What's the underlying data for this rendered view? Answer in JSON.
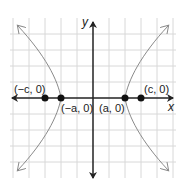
{
  "diagram": {
    "type": "hyperbola",
    "axes": {
      "x_label": "x",
      "y_label": "y"
    },
    "grid": {
      "on": true,
      "spacing_units": 1,
      "x_range": [
        -5,
        5
      ],
      "y_range": [
        -4,
        5
      ]
    },
    "points": [
      {
        "label": "(−c, 0)",
        "x": -3,
        "y": 0
      },
      {
        "label": "(−a, 0)",
        "x": -2,
        "y": 0
      },
      {
        "label": "(a, 0)",
        "x": 2,
        "y": 0
      },
      {
        "label": "(c, 0)",
        "x": 3,
        "y": 0
      }
    ],
    "colors": {
      "grid": "#d8d8d8",
      "axis": "#222222",
      "curve": "#8a8a8a",
      "point": "#111111"
    }
  }
}
